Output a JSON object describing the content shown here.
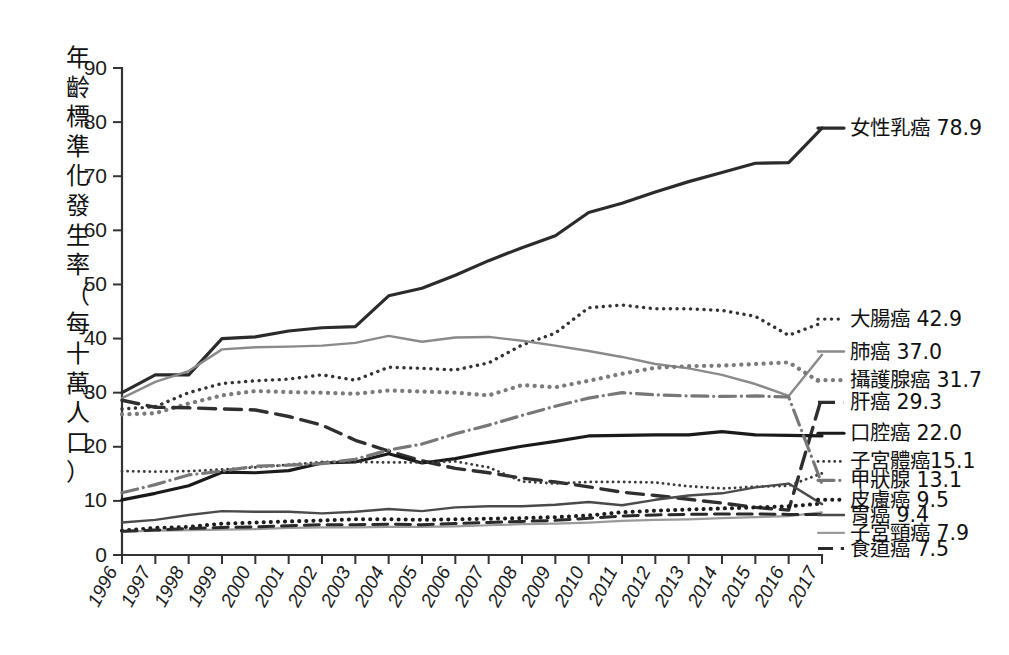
{
  "axes": {
    "y_label": "年齡標準化發生率（每十萬人口）",
    "y_ticks": [
      "0",
      "10",
      "20",
      "30",
      "40",
      "50",
      "60",
      "70",
      "80",
      "90"
    ],
    "y_min": 0,
    "y_max": 90,
    "x_ticks": [
      "1996",
      "1997",
      "1998",
      "1999",
      "2000",
      "2001",
      "2002",
      "2003",
      "2004",
      "2005",
      "2006",
      "2007",
      "2008",
      "2009",
      "2010",
      "2011",
      "2012",
      "2013",
      "2014",
      "2015",
      "2016",
      "2017"
    ]
  },
  "chart_data": {
    "type": "line",
    "title": "",
    "subtitle": "",
    "xlabel": "",
    "ylabel": "年齡標準化發生率（每十萬人口）",
    "ylim": [
      0,
      90
    ],
    "xlim": [
      "1996",
      "2017"
    ],
    "grid": false,
    "legend_position": "right-end-of-line",
    "x": [
      "1996",
      "1997",
      "1998",
      "1999",
      "2000",
      "2001",
      "2002",
      "2003",
      "2004",
      "2005",
      "2006",
      "2007",
      "2008",
      "2009",
      "2010",
      "2011",
      "2012",
      "2013",
      "2014",
      "2015",
      "2016",
      "2017"
    ],
    "series": [
      {
        "name": "女性乳癌",
        "label": "女性乳癌 78.9",
        "end_value": "78.9",
        "color": "#2b2b2b",
        "style": "solid",
        "width": 3.2,
        "label_y": 78.9,
        "values": [
          30.0,
          33.3,
          33.3,
          40.0,
          40.3,
          41.4,
          42.0,
          42.2,
          47.9,
          49.3,
          51.7,
          54.4,
          56.8,
          59.0,
          63.3,
          65.0,
          67.1,
          69.0,
          70.7,
          72.4,
          72.5,
          78.9
        ]
      },
      {
        "name": "大腸癌",
        "label": "大腸癌 42.9",
        "end_value": "42.9",
        "color": "#333333",
        "style": "dotted-fine",
        "width": 3.4,
        "label_y": 43.6,
        "values": [
          27.0,
          27.4,
          30.0,
          31.7,
          32.2,
          32.5,
          33.3,
          32.3,
          34.7,
          34.5,
          34.2,
          35.5,
          38.8,
          41.0,
          45.7,
          46.2,
          45.5,
          45.5,
          45.2,
          44.1,
          40.6,
          42.9
        ]
      },
      {
        "name": "肺癌",
        "label": "肺癌 37.0",
        "end_value": "37.0",
        "color": "#8a8a8a",
        "style": "solid",
        "width": 2.4,
        "label_y": 37.6,
        "values": [
          29.0,
          32.0,
          34.0,
          38.0,
          38.4,
          38.5,
          38.7,
          39.2,
          40.5,
          39.4,
          40.2,
          40.3,
          39.6,
          38.7,
          37.7,
          36.6,
          35.3,
          34.5,
          33.3,
          31.6,
          29.4,
          37.0
        ]
      },
      {
        "name": "攝護腺癌",
        "label": "攝護腺癌 31.7",
        "end_value": "31.7",
        "color": "#7b7b7b",
        "style": "thick-dotted",
        "width": 4.2,
        "label_y": 32.3,
        "values": [
          26.0,
          26.2,
          28.0,
          29.5,
          30.3,
          30.1,
          30.0,
          29.8,
          30.4,
          30.2,
          30.0,
          29.5,
          31.4,
          31.0,
          32.2,
          33.5,
          34.6,
          34.9,
          35.0,
          35.3,
          35.6,
          31.7
        ]
      },
      {
        "name": "肝癌",
        "label": "肝癌 29.3",
        "end_value": "29.3",
        "color": "#2f2f2f",
        "style": "long-dash",
        "width": 3.4,
        "label_y": 28.2,
        "values": [
          28.6,
          27.3,
          27.2,
          27.0,
          26.8,
          25.6,
          24.0,
          21.2,
          19.2,
          17.4,
          16.0,
          15.2,
          14.2,
          13.5,
          12.6,
          11.6,
          11.0,
          10.3,
          9.6,
          8.8,
          8.3,
          29.3
        ]
      },
      {
        "name": "口腔癌",
        "label": "口腔癌 22.0",
        "end_value": "22.0",
        "color": "#1a1a1a",
        "style": "solid",
        "width": 3.2,
        "label_y": 22.5,
        "values": [
          10.2,
          11.4,
          12.8,
          15.3,
          15.2,
          15.6,
          17.0,
          17.2,
          18.7,
          17.0,
          17.8,
          19.0,
          20.1,
          21.0,
          22.0,
          22.1,
          22.2,
          22.2,
          22.8,
          22.2,
          22.1,
          22.0
        ]
      },
      {
        "name": "子宮體癌",
        "label": "子宮體癌15.1",
        "end_value": "15.1",
        "color": "#3a3a3a",
        "style": "dotted-fine",
        "width": 2.8,
        "label_y": 17.3,
        "values": [
          15.5,
          15.4,
          15.5,
          15.8,
          16.2,
          16.7,
          17.2,
          17.2,
          17.1,
          17.1,
          17.3,
          16.2,
          13.6,
          13.2,
          13.5,
          13.5,
          13.4,
          12.7,
          12.3,
          12.6,
          12.8,
          15.1
        ]
      },
      {
        "name": "甲狀腺",
        "label": "甲狀腺 13.1",
        "end_value": "13.1",
        "color": "#777777",
        "style": "dash-dot",
        "width": 3.2,
        "label_y": 13.8,
        "values": [
          11.5,
          13.0,
          14.8,
          15.5,
          16.4,
          16.6,
          16.9,
          17.7,
          19.4,
          20.5,
          22.4,
          24.0,
          25.8,
          27.5,
          29.0,
          30.0,
          29.6,
          29.4,
          29.3,
          29.4,
          29.2,
          13.1
        ]
      },
      {
        "name": "皮膚癌",
        "label": "皮膚癌 9.5",
        "end_value": "9.5",
        "color": "#1c1c1c",
        "style": "thick-dotted",
        "width": 4.0,
        "label_y": 10.2,
        "values": [
          4.5,
          5.0,
          5.2,
          5.8,
          6.0,
          6.2,
          6.4,
          6.6,
          6.6,
          6.5,
          6.6,
          6.7,
          6.8,
          7.0,
          7.3,
          7.9,
          8.2,
          8.4,
          8.6,
          8.8,
          9.0,
          9.5
        ]
      },
      {
        "name": "胃癌",
        "label": "胃癌 9.4",
        "end_value": "9.4",
        "color": "#4a4a4a",
        "style": "solid",
        "width": 2.4,
        "label_y": 7.4,
        "values": [
          6.0,
          6.5,
          7.4,
          8.1,
          8.0,
          8.0,
          7.7,
          8.0,
          8.5,
          8.1,
          8.8,
          9.0,
          9.0,
          9.3,
          9.8,
          9.2,
          10.2,
          11.0,
          11.4,
          12.5,
          13.2,
          9.4
        ]
      },
      {
        "name": "子宮頸癌",
        "label": "子宮頸癌 7.9",
        "end_value": "7.9",
        "color": "#9a9a9a",
        "style": "solid",
        "width": 2.2,
        "label_y": 4.1,
        "values": [
          4.3,
          4.5,
          4.6,
          4.7,
          4.8,
          5.0,
          5.1,
          5.1,
          5.2,
          5.2,
          5.3,
          5.5,
          5.7,
          5.8,
          6.0,
          6.3,
          6.5,
          6.6,
          6.8,
          7.0,
          7.2,
          7.9
        ]
      },
      {
        "name": "食道癌",
        "label": "食道癌 7.5",
        "end_value": "7.5",
        "color": "#2a2a2a",
        "style": "long-dash",
        "width": 3.0,
        "label_y": 1.2,
        "values": [
          4.4,
          4.6,
          4.9,
          5.1,
          5.2,
          5.4,
          5.6,
          5.6,
          5.7,
          5.6,
          5.8,
          6.0,
          6.2,
          6.4,
          6.8,
          7.2,
          7.4,
          7.5,
          7.6,
          7.6,
          7.5,
          7.5
        ]
      }
    ]
  }
}
